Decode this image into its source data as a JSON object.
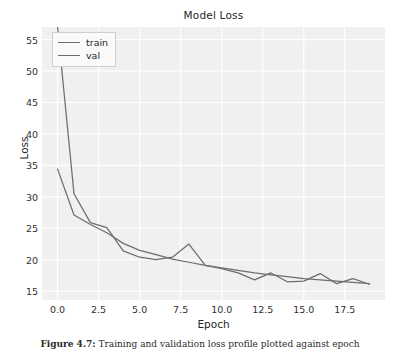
{
  "figure": {
    "title": "Model Loss",
    "xlabel": "Epoch",
    "ylabel": "Loss",
    "caption_prefix": "Figure 4.7:",
    "caption_text": "Training and validation loss profile plotted against epoch",
    "background_color": "#f0f0f0",
    "grid_color": "#ffffff",
    "line_color": "#6d6d6d",
    "text_color": "#262626"
  },
  "legend": {
    "position": "upper left",
    "entries": [
      {
        "label": "train"
      },
      {
        "label": "val"
      }
    ]
  },
  "axes": {
    "x_ticks": [
      "0.0",
      "2.5",
      "5.0",
      "7.5",
      "10.0",
      "12.5",
      "15.0",
      "17.5"
    ],
    "x_tick_values": [
      0.0,
      2.5,
      5.0,
      7.5,
      10.0,
      12.5,
      15.0,
      17.5
    ],
    "y_ticks": [
      "15",
      "20",
      "25",
      "30",
      "35",
      "40",
      "45",
      "50",
      "55"
    ],
    "y_tick_values": [
      15,
      20,
      25,
      30,
      35,
      40,
      45,
      50,
      55
    ]
  },
  "chart_data": {
    "type": "line",
    "title": "Model Loss",
    "xlabel": "Epoch",
    "ylabel": "Loss",
    "xlim": [
      -0.95,
      19.95
    ],
    "ylim": [
      13.6,
      57.0
    ],
    "grid": true,
    "legend": "upper left",
    "x": [
      0,
      1,
      2,
      3,
      4,
      5,
      6,
      7,
      8,
      9,
      10,
      11,
      12,
      13,
      14,
      15,
      16,
      17,
      18,
      19
    ],
    "series": [
      {
        "name": "train",
        "values": [
          34.4,
          27.1,
          25.6,
          24.3,
          22.6,
          21.5,
          20.8,
          20.1,
          19.6,
          19.1,
          18.7,
          18.3,
          17.9,
          17.6,
          17.3,
          17.0,
          16.8,
          16.6,
          16.4,
          16.2
        ]
      },
      {
        "name": "val",
        "values": [
          57.0,
          30.5,
          25.9,
          25.1,
          21.4,
          20.4,
          20.0,
          20.4,
          22.5,
          19.1,
          18.6,
          17.9,
          16.8,
          17.9,
          16.5,
          16.6,
          17.8,
          16.2,
          17.0,
          16.1
        ]
      }
    ]
  }
}
